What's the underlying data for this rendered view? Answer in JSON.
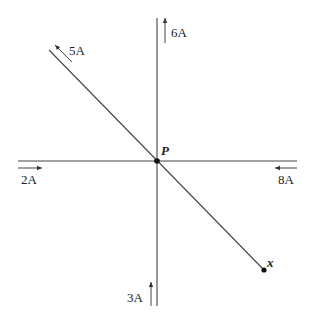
{
  "diagram": {
    "colors": {
      "line": "#444444",
      "text": "#222222",
      "background": "#ffffff"
    },
    "point_p": {
      "label": "P"
    },
    "point_x": {
      "label": "x"
    },
    "currents": [
      {
        "id": "diag-upper",
        "label": "5A",
        "direction": "up-left along diagonal"
      },
      {
        "id": "vert-upper",
        "label": "6A",
        "direction": "up"
      },
      {
        "id": "horiz-left",
        "label": "2A",
        "direction": "right"
      },
      {
        "id": "horiz-right",
        "label": "8A",
        "direction": "left"
      },
      {
        "id": "vert-lower",
        "label": "3A",
        "direction": "up"
      }
    ]
  }
}
